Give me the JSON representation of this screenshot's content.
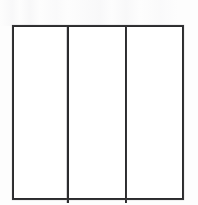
{
  "figure": {
    "medium": "scanned line drawing",
    "background_color": "#fdfdfd",
    "panel_fill_color": "#ffffff",
    "stroke_color": "#2b2b2d",
    "stroke_width": 2,
    "canvas": {
      "width": 198,
      "height": 205
    }
  },
  "frame": {
    "name": "outer-frame",
    "left": 13,
    "top": 26,
    "right": 183,
    "bottom": 199,
    "width": 170,
    "height": 173
  },
  "dividers": [
    {
      "name": "divider-1",
      "x": 67.5,
      "top": 26,
      "bottom": 203
    },
    {
      "name": "divider-2",
      "x": 125.5,
      "top": 26,
      "bottom": 203
    }
  ],
  "panels": [
    {
      "name": "panel-left",
      "label": "",
      "x": 14,
      "y": 27,
      "width": 52.5,
      "height": 171
    },
    {
      "name": "panel-center",
      "label": "",
      "x": 68.5,
      "y": 27,
      "width": 56,
      "height": 171
    },
    {
      "name": "panel-right",
      "label": "",
      "x": 126.5,
      "y": 27,
      "width": 56,
      "height": 171
    }
  ],
  "counts": {
    "panel_count": 3,
    "divider_count": 2
  }
}
